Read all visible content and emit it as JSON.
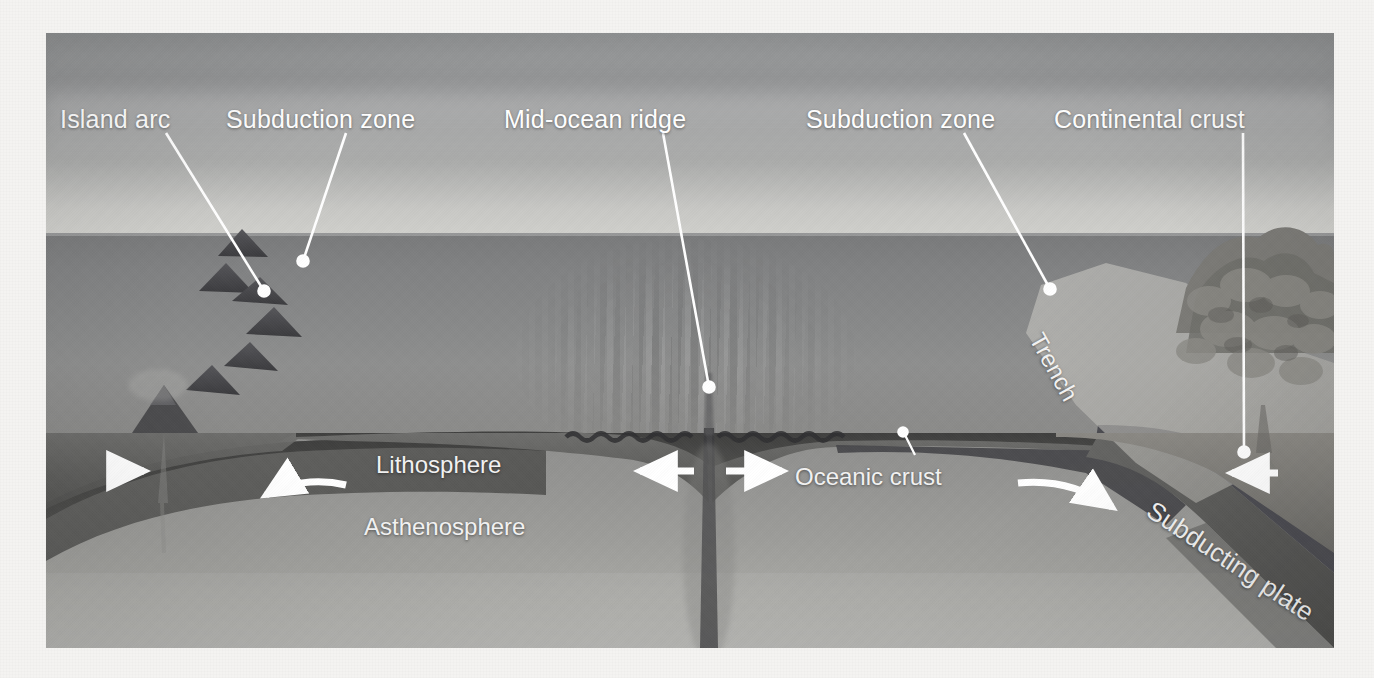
{
  "figure": {
    "frame": {
      "left": 46,
      "top": 33,
      "width": 1288,
      "height": 615
    },
    "page_background": "#f4f3f1"
  },
  "callout_labels": [
    {
      "id": "island-arc",
      "text": "Island arc",
      "x": 14,
      "y": 72
    },
    {
      "id": "subduction-zone-l",
      "text": "Subduction zone",
      "x": 180,
      "y": 72
    },
    {
      "id": "mid-ocean-ridge",
      "text": "Mid-ocean ridge",
      "x": 458,
      "y": 72
    },
    {
      "id": "subduction-zone-r",
      "text": "Subduction zone",
      "x": 760,
      "y": 72
    },
    {
      "id": "continental-crust",
      "text": "Continental crust",
      "x": 1008,
      "y": 72
    }
  ],
  "inner_labels": [
    {
      "id": "lithosphere",
      "text": "Lithosphere",
      "x": 330,
      "y": 431
    },
    {
      "id": "asthenosphere",
      "text": "Asthenosphere",
      "x": 318,
      "y": 492
    },
    {
      "id": "oceanic-crust",
      "text": "Oceanic crust",
      "x": 749,
      "y": 440
    },
    {
      "id": "trench",
      "text": "Trench",
      "x": 1000,
      "y": 300
    },
    {
      "id": "subducting-plate",
      "text": "Subducting plate",
      "x": 1110,
      "y": 465
    }
  ],
  "leader_lines": [
    {
      "id": "leader-island-arc",
      "x1": 120,
      "y1": 100,
      "x2": 218,
      "y2": 258,
      "dot": true
    },
    {
      "id": "leader-subduction-left",
      "x1": 300,
      "y1": 100,
      "x2": 257,
      "y2": 228,
      "dot": true
    },
    {
      "id": "leader-mid-ocean-ridge",
      "x1": 617,
      "y1": 100,
      "x2": 663,
      "y2": 354,
      "dot": true
    },
    {
      "id": "leader-subduction-right",
      "x1": 918,
      "y1": 100,
      "x2": 1004,
      "y2": 256,
      "dot": true
    },
    {
      "id": "leader-continental-crust",
      "x1": 1197,
      "y1": 100,
      "x2": 1198,
      "y2": 419,
      "dot": true
    },
    {
      "id": "leader-oceanic-crust",
      "x1": 869,
      "y1": 420,
      "x2": 858,
      "y2": 400,
      "dot": true
    }
  ],
  "motion_arrows": [
    {
      "id": "arrow-far-left-right",
      "type": "straight",
      "direction": "right",
      "x": 63,
      "y": 438,
      "length": 42
    },
    {
      "id": "arrow-left-slab-curved",
      "type": "curved",
      "direction": "left",
      "x": 218,
      "y": 462
    },
    {
      "id": "arrow-ridge-left",
      "type": "straight",
      "direction": "left",
      "x": 592,
      "y": 438,
      "length": 58
    },
    {
      "id": "arrow-ridge-right",
      "type": "straight",
      "direction": "right",
      "x": 686,
      "y": 438,
      "length": 58
    },
    {
      "id": "arrow-right-slab-curved",
      "type": "curved",
      "direction": "right",
      "x": 1022,
      "y": 452
    },
    {
      "id": "arrow-far-right-left",
      "type": "straight",
      "direction": "left",
      "x": 1190,
      "y": 440,
      "length": 48
    }
  ],
  "layers": {
    "sky": {
      "name": "Sky",
      "top": 0,
      "height": 200,
      "color": "#9a9b9b"
    },
    "water": {
      "name": "Ocean water",
      "top": 200,
      "height": 206,
      "color": "#87888a"
    },
    "lithosphere": {
      "name": "Lithosphere",
      "top": 400,
      "height": 62,
      "color": "#5f5f5e"
    },
    "oceanic_crust": {
      "name": "Oceanic crust",
      "color": "#4a4a49"
    },
    "asthenosphere": {
      "name": "Asthenosphere",
      "top": 400,
      "height": 215,
      "color": "#9d9d9a"
    },
    "continent": {
      "name": "Continental crust",
      "color": "#7d7c78"
    }
  },
  "features": {
    "island_arc_volcano_count": 6,
    "mid_ocean_ridge": {
      "name": "Mid-ocean ridge",
      "center_x": 663,
      "rift_valley": true
    },
    "trench": {
      "name": "Trench",
      "x": 1030
    },
    "subducting_plate_dip_deg": 33.5,
    "left_slab_dip_deg": 29
  },
  "colors": {
    "label_text": "#ffffff",
    "leader_line": "#ffffff",
    "arrow": "#ffffff",
    "page": "#f4f3f1"
  }
}
